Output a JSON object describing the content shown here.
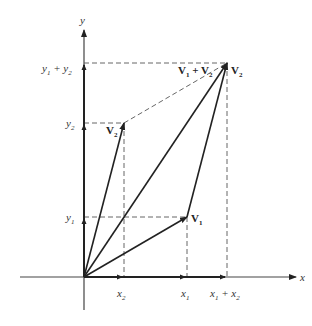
{
  "diagram": {
    "axes": {
      "x_label": "x",
      "y_label": "y"
    },
    "x_ticks": [
      {
        "label": "x",
        "sub": "2",
        "extra": ""
      },
      {
        "label": "x",
        "sub": "1",
        "extra": ""
      },
      {
        "label": "x",
        "sub": "1",
        "extra": " + x",
        "extra_sub": "2"
      }
    ],
    "y_ticks": [
      {
        "label": "y",
        "sub": "1"
      },
      {
        "label": "y",
        "sub": "2"
      },
      {
        "label": "y",
        "sub": "1",
        "extra": " + y",
        "extra_sub": "2"
      }
    ],
    "vectors": [
      {
        "name": "V",
        "sub": "1"
      },
      {
        "name": "V",
        "sub": "2"
      },
      {
        "name": "V",
        "sub": "1",
        "plus": " + V",
        "plus_sub": "2"
      },
      {
        "name": "V",
        "sub": "2"
      }
    ],
    "colors": {
      "line": "#222222",
      "axis": "#444444",
      "dashed": "#555555"
    }
  }
}
